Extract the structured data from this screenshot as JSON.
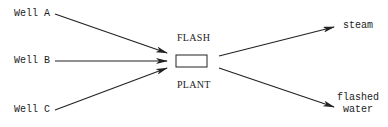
{
  "diagram": {
    "inputs": [
      {
        "label": "Well A"
      },
      {
        "label": "Well B"
      },
      {
        "label": "Well C"
      }
    ],
    "process": {
      "label_top": "FLASH",
      "label_bottom": "PLANT"
    },
    "outputs": [
      {
        "label": "steam"
      },
      {
        "label_line1": "flashed",
        "label_line2": "water"
      }
    ],
    "colors": {
      "stroke": "#222222",
      "background": "#ffffff"
    }
  }
}
